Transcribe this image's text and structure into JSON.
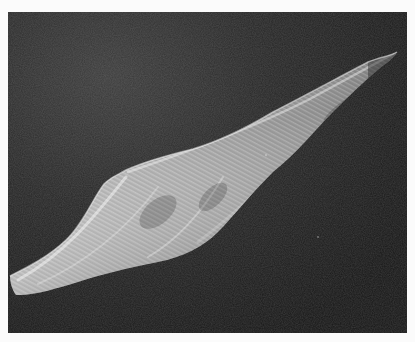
{
  "image": {
    "type": "micrograph",
    "style": "grayscale scanning electron micrograph",
    "subject": "isolated spindle-shaped cell with longitudinal surface striations",
    "background": "dark granular field",
    "border": "white margin around photo",
    "colors": {
      "page": "#fbfbfb",
      "background_dark": "#1c1c1c",
      "background_light": "#3a3a3a",
      "cell_highlight": "#e8e8e8",
      "cell_mid": "#a8a8a8",
      "cell_shadow": "#5a5a5a"
    }
  }
}
